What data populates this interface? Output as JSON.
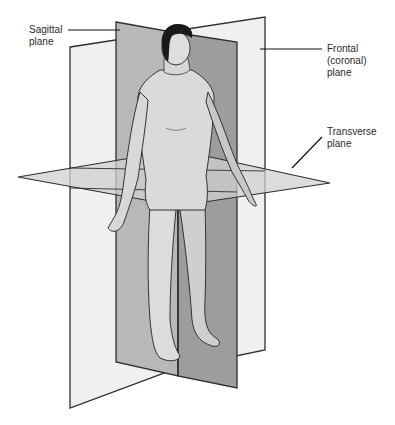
{
  "diagram": {
    "labels": {
      "sagittal": [
        "Sagittal",
        "plane"
      ],
      "frontal": [
        "Frontal",
        "(coronal)",
        "plane"
      ],
      "transverse": [
        "Transverse",
        "plane"
      ]
    },
    "caption": "",
    "colors": {
      "background": "#ffffff",
      "frontal_plane": "#efefef",
      "sagittal_plane": "#a9a9a9",
      "sagittal_plane_front": "#9c9c9c",
      "transverse_plane": "#d3d3d3",
      "outline": "#2e2e2e",
      "skin": "#d9d9d9",
      "hair": "#1a1a1a"
    }
  }
}
